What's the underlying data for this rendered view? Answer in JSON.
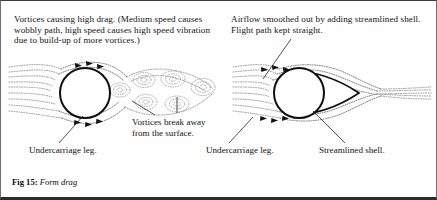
{
  "figure": {
    "number_label": "Fig 15:",
    "title": "Form drag"
  },
  "panels": {
    "left": {
      "caption": "Vortices causing high drag. (Medium speed causes wobbly path, high speed causes high speed vibration due to build-up of more vortices.)",
      "labels": {
        "vortices_break": "Vortices break away from the surface.",
        "undercarriage_leg": "Undercarriage leg."
      }
    },
    "right": {
      "caption": "Airflow smoothed out by adding streamlined shell. Flight path kept straight.",
      "labels": {
        "undercarriage_leg": "Undercarriage leg.",
        "streamlined_shell": "Streamlined shell."
      }
    }
  },
  "colors": {
    "ink": "#121212",
    "streamline": "#8d8d8d",
    "vortex": "#9a9a9a",
    "border_bottom": "#2b2b2b"
  }
}
